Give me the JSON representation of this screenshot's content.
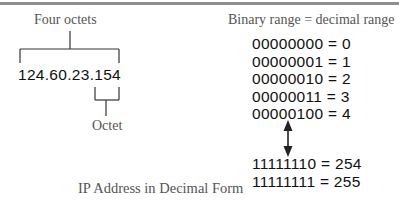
{
  "diagram": {
    "left": {
      "top_label": "Four octets",
      "ip_address": "124.60.23.154",
      "bottom_label": "Octet"
    },
    "right": {
      "header": "Binary range = decimal range",
      "rows_top": [
        {
          "text": "00000000 = 0"
        },
        {
          "text": "00000001 = 1"
        },
        {
          "text": "00000010 = 2"
        },
        {
          "text": "00000011 = 3"
        },
        {
          "text": "00000100 = 4"
        }
      ],
      "rows_bottom": [
        {
          "text": "11111110 = 254"
        },
        {
          "text": "11111111 = 255"
        }
      ]
    },
    "caption": "IP Address in Decimal Form",
    "colors": {
      "rule": "#8f8f8f",
      "label": "#555555",
      "text": "#111111",
      "line": "#333333"
    }
  }
}
